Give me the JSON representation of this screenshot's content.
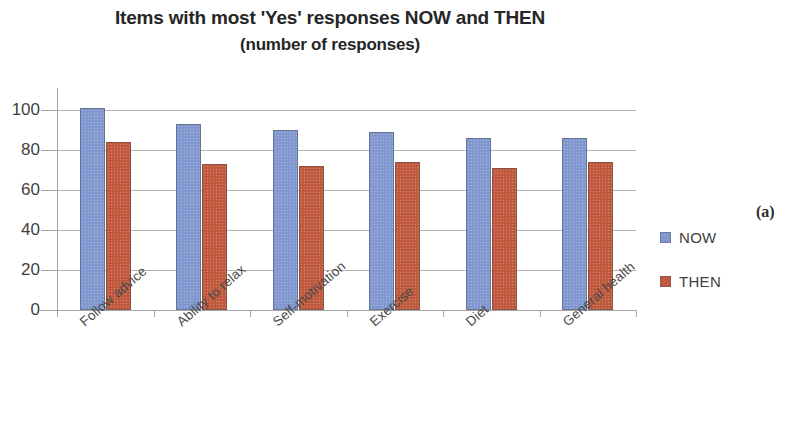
{
  "figure": {
    "caption_label": "(a)"
  },
  "chart_data": {
    "type": "bar",
    "title": "Items with most 'Yes' responses NOW and THEN",
    "subtitle": "(number of responses)",
    "xlabel": "",
    "ylabel": "",
    "ylim": [
      0,
      110
    ],
    "yticks": [
      0,
      20,
      40,
      60,
      80,
      100
    ],
    "ytick_labels": [
      "0",
      "20",
      "40",
      "60",
      "80",
      "100"
    ],
    "grid": true,
    "legend_position": "right",
    "categories": [
      "Follow advice",
      "Ability to relax",
      "Self-motivation",
      "Exercise",
      "Diet",
      "General health"
    ],
    "series": [
      {
        "name": "NOW",
        "color": "#8097cf",
        "values": [
          101,
          93,
          90,
          89,
          86,
          86
        ]
      },
      {
        "name": "THEN",
        "color": "#c05a3e",
        "values": [
          84,
          73,
          72,
          74,
          71,
          74
        ]
      }
    ]
  }
}
